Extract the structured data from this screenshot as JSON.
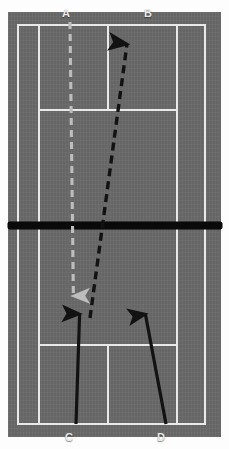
{
  "diagram": {
    "surface_color": "#6a6a6a",
    "line_color": "#e9e9e9",
    "net_color": "#0a0a0a",
    "court": {
      "outer_left_x": 17,
      "outer_right_x": 205,
      "outer_top_y": 24,
      "outer_bottom_y": 424,
      "singles_left_x": 38,
      "singles_right_x": 177,
      "service_line_top_y": 110,
      "service_line_bottom_y": 345,
      "center_service_x": 108,
      "net_y": 226
    },
    "labels": [
      {
        "id": "A",
        "text": "A",
        "x": 62,
        "y": 8,
        "position": "top",
        "color": "#e8e8e8"
      },
      {
        "id": "B",
        "text": "B",
        "x": 144,
        "y": 8,
        "position": "top",
        "color": "#e8e8e8"
      },
      {
        "id": "C",
        "text": "C",
        "x": 65,
        "y": 432,
        "position": "bottom",
        "color": "#e8e8e8"
      },
      {
        "id": "D",
        "text": "D",
        "x": 157,
        "y": 432,
        "position": "bottom",
        "color": "#e8e8e8"
      }
    ],
    "arrows": [
      {
        "id": "grey-dashed-down",
        "style": "dashed",
        "color": "#b9b9b9",
        "direction": "down",
        "from": {
          "x": 70,
          "y": 22
        },
        "to": {
          "x": 74,
          "y": 305
        },
        "description": "Grey dashed shot travelling from A down past the net"
      },
      {
        "id": "black-dashed-up",
        "style": "dashed",
        "color": "#121212",
        "direction": "up",
        "from": {
          "x": 90,
          "y": 318
        },
        "to": {
          "x": 128,
          "y": 36
        },
        "description": "Black dashed shot travelling up toward B"
      },
      {
        "id": "black-solid-left",
        "style": "solid",
        "color": "#121212",
        "direction": "up",
        "from": {
          "x": 76,
          "y": 424
        },
        "to": {
          "x": 80,
          "y": 306
        },
        "description": "Solid black player run from C"
      },
      {
        "id": "black-solid-right",
        "style": "solid",
        "color": "#121212",
        "direction": "up",
        "from": {
          "x": 166,
          "y": 424
        },
        "to": {
          "x": 144,
          "y": 306
        },
        "description": "Solid black player run from D"
      }
    ]
  }
}
